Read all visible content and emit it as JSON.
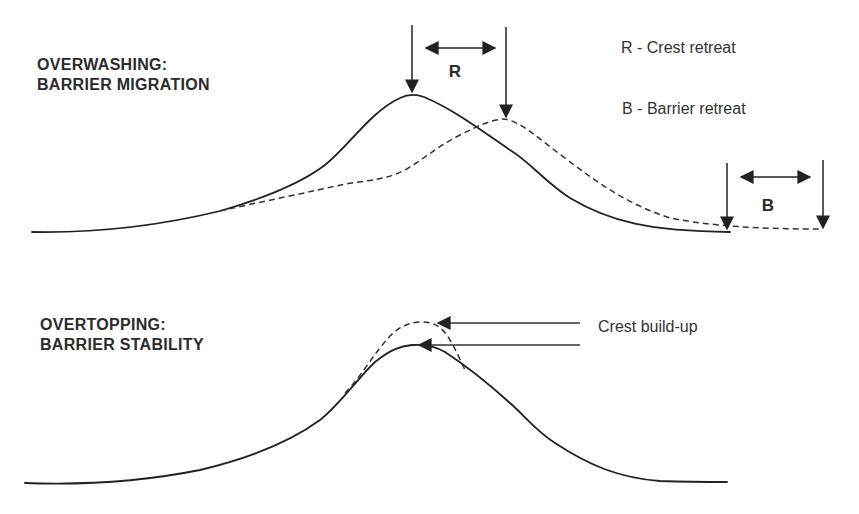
{
  "panels": [
    {
      "id": "overwashing",
      "title_line1": "OVERWASHING:",
      "title_line2": "BARRIER MIGRATION",
      "profiles": {
        "solid": "original barrier profile",
        "dashed": "migrated barrier profile"
      },
      "markers": {
        "R": "R",
        "B": "B"
      },
      "legend": [
        {
          "key": "R",
          "text": "R - Crest retreat"
        },
        {
          "key": "B",
          "text": "B - Barrier retreat"
        }
      ]
    },
    {
      "id": "overtopping",
      "title_line1": "OVERTOPPING:",
      "title_line2": "BARRIER STABILITY",
      "profiles": {
        "solid": "original barrier profile",
        "dashed": "raised crest profile"
      },
      "annotation": "Crest build-up"
    }
  ],
  "colors": {
    "ink": "#222222",
    "background": "#ffffff"
  }
}
